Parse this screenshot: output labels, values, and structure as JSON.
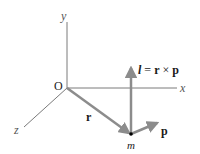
{
  "diagram": {
    "axes": {
      "y_label": "y",
      "x_label": "x",
      "z_label": "z",
      "origin_label": "O"
    },
    "vectors": {
      "r_label": "r",
      "p_label": "p",
      "l_label_l": "l",
      "l_label_eq": " = ",
      "l_label_r": "r",
      "l_label_times": " × ",
      "l_label_p": "p"
    },
    "particle_label": "m",
    "colors": {
      "axis": "#7a7a7a",
      "vector": "#8c8c8c",
      "text": "#1a1a1a",
      "particle": "#000000"
    }
  }
}
